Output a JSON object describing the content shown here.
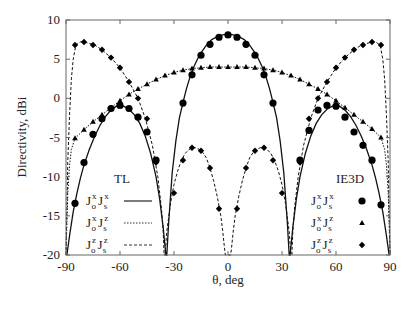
{
  "chart_data": {
    "type": "line",
    "title": "",
    "xlabel": "θ, deg",
    "ylabel": "Directivity, dBi",
    "xlim": [
      -90,
      90
    ],
    "ylim": [
      -20,
      10
    ],
    "xticks": [
      -90,
      -60,
      -30,
      0,
      30,
      60,
      90
    ],
    "yticks": [
      10,
      5,
      0,
      -5,
      -10,
      -15,
      -20
    ],
    "grid": false,
    "legend": {
      "tl_title": "TL",
      "ie3d_title": "IE3D",
      "entries": [
        {
          "label_main1": "J",
          "sup1": "x",
          "sub1": "o",
          "label_main2": "J",
          "sup2": "x",
          "sub2": "s",
          "tl_style": "solid",
          "ie3d_marker": "circle"
        },
        {
          "label_main1": "J",
          "sup1": "x",
          "sub1": "o",
          "label_main2": "J",
          "sup2": "z",
          "sub2": "s",
          "tl_style": "dotted",
          "ie3d_marker": "triangle"
        },
        {
          "label_main1": "J",
          "sup1": "z",
          "sub1": "o",
          "label_main2": "J",
          "sup2": "z",
          "sub2": "s",
          "tl_style": "dashed",
          "ie3d_marker": "diamond"
        }
      ]
    },
    "series": [
      {
        "name": "Jo^x Js^x",
        "method_tl": "solid",
        "marker": "circle",
        "tl_curve": {
          "x": [
            -89.5,
            -88,
            -86,
            -84,
            -82,
            -80,
            -77,
            -74,
            -71,
            -68,
            -65,
            -62,
            -60,
            -58,
            -55,
            -52,
            -49,
            -46,
            -43,
            -40,
            -38,
            -36,
            -34.5,
            -34,
            -33,
            -31,
            -29,
            -27,
            -25,
            -23,
            -21,
            -19,
            -17,
            -15,
            -12,
            -9,
            -6,
            -3,
            0,
            3,
            6,
            9,
            12,
            15,
            17,
            19,
            21,
            23,
            25,
            27,
            29,
            31,
            33,
            34,
            34.5,
            36,
            38,
            40,
            43,
            46,
            49,
            52,
            55,
            58,
            60,
            62,
            65,
            68,
            71,
            74,
            77,
            80,
            82,
            84,
            86,
            88,
            89.5
          ],
          "y": [
            -20,
            -17.5,
            -14.5,
            -12.2,
            -10.2,
            -8.5,
            -6.5,
            -4.8,
            -3.4,
            -2.3,
            -1.5,
            -1.0,
            -0.9,
            -1.0,
            -1.4,
            -2.1,
            -3.2,
            -4.8,
            -7.0,
            -10.0,
            -12.8,
            -16.5,
            -20,
            -20,
            -16,
            -9.5,
            -5.5,
            -2.5,
            -0.5,
            1.3,
            2.8,
            4.0,
            5.0,
            5.8,
            6.8,
            7.5,
            7.9,
            8.1,
            8.2,
            8.1,
            7.9,
            7.5,
            6.8,
            5.8,
            5.0,
            4.0,
            2.8,
            1.3,
            -0.5,
            -2.5,
            -5.5,
            -9.5,
            -16,
            -20,
            -20,
            -16.5,
            -12.8,
            -10.0,
            -7.0,
            -4.8,
            -3.2,
            -2.1,
            -1.4,
            -1.0,
            -0.9,
            -1.0,
            -1.5,
            -2.3,
            -3.4,
            -4.8,
            -6.5,
            -8.5,
            -10.2,
            -12.2,
            -14.5,
            -17.5,
            -20
          ]
        },
        "ie3d_points": {
          "x": [
            -85,
            -80,
            -75,
            -70,
            -65,
            -60,
            -55,
            -50,
            -45,
            -40,
            -25,
            -20,
            -15,
            -10,
            -5,
            0,
            5,
            10,
            15,
            20,
            25,
            40,
            45,
            50,
            55,
            60,
            65,
            70,
            75,
            80,
            85
          ],
          "y": [
            -13.4,
            -8.2,
            -4.6,
            -2.6,
            -1.3,
            -0.9,
            -1.3,
            -2.4,
            -4.3,
            -7.9,
            -0.6,
            3.0,
            5.5,
            6.9,
            7.8,
            8.1,
            7.8,
            6.9,
            5.5,
            3.0,
            -0.6,
            -7.9,
            -4.1,
            -1.5,
            -0.9,
            -1.0,
            -2.4,
            -4.3,
            -6.0,
            -7.9,
            -13.6
          ]
        }
      },
      {
        "name": "Jo^x Js^z",
        "method_tl": "dotted",
        "marker": "triangle",
        "tl_curve": {
          "x": [
            -90,
            -89.5,
            -89,
            -88,
            -87,
            -85,
            -80,
            -75,
            -70,
            -65,
            -60,
            -55,
            -50,
            -45,
            -40,
            -35,
            -30,
            -25,
            -20,
            -15,
            -10,
            -5,
            0,
            5,
            10,
            15,
            20,
            25,
            30,
            35,
            40,
            45,
            50,
            55,
            60,
            65,
            70,
            75,
            80,
            85,
            87,
            88,
            89,
            89.5,
            90
          ],
          "y": [
            -20,
            -16,
            -12,
            -8.5,
            -6.5,
            -5.1,
            -4.0,
            -3.0,
            -2.1,
            -1.2,
            -0.3,
            0.5,
            1.2,
            1.8,
            2.4,
            2.9,
            3.3,
            3.6,
            3.8,
            3.9,
            4.0,
            4.0,
            4.0,
            4.0,
            4.0,
            3.9,
            3.8,
            3.6,
            3.3,
            2.9,
            2.4,
            1.8,
            1.2,
            0.5,
            -0.3,
            -1.2,
            -2.1,
            -3.0,
            -3.9,
            -5.0,
            -6.5,
            -8.5,
            -12,
            -16,
            -20
          ]
        },
        "ie3d_points": {
          "x": [
            -85,
            -80,
            -75,
            -70,
            -65,
            -60,
            -55,
            -50,
            -45,
            -40,
            -35,
            -30,
            -25,
            -20,
            -15,
            -10,
            -5,
            0,
            5,
            10,
            15,
            20,
            25,
            30,
            35,
            40,
            45,
            50,
            55,
            60,
            65,
            70,
            75,
            80,
            85
          ],
          "y": [
            -5.1,
            -4.0,
            -3.0,
            -2.1,
            -1.2,
            -0.3,
            0.5,
            1.2,
            1.8,
            2.4,
            2.9,
            3.3,
            3.6,
            3.8,
            3.9,
            4.0,
            4.0,
            4.0,
            4.0,
            4.0,
            3.9,
            3.8,
            3.6,
            3.3,
            2.9,
            2.4,
            1.8,
            1.2,
            0.5,
            -0.3,
            -1.2,
            -2.1,
            -3.0,
            -3.9,
            -5.0
          ]
        }
      },
      {
        "name": "Jo^z Js^z",
        "method_tl": "dashed",
        "marker": "diamond",
        "tl_curve": {
          "x": [
            -90,
            -89.5,
            -89,
            -88,
            -87,
            -86,
            -84.5,
            -82,
            -80,
            -77,
            -74,
            -70,
            -65,
            -60,
            -55,
            -50,
            -46,
            -42,
            -39,
            -37,
            -36,
            -35.5,
            -35,
            -34,
            -32,
            -30,
            -28,
            -26,
            -24,
            -22,
            -20,
            -18,
            -16,
            -14,
            -12,
            -10,
            -8,
            -6,
            -4,
            -3,
            -2,
            -1.5,
            1.5,
            2,
            3,
            4,
            6,
            8,
            10,
            12,
            14,
            16,
            18,
            20,
            22,
            24,
            26,
            28,
            30,
            32,
            34,
            35,
            35.5,
            36,
            37,
            39,
            42,
            46,
            50,
            55,
            60,
            65,
            70,
            74,
            77,
            80,
            82,
            84.5,
            86,
            87,
            88,
            89,
            89.5,
            90
          ],
          "y": [
            -20,
            -14,
            -8,
            -2,
            2.5,
            5.0,
            6.8,
            7.2,
            7.2,
            7.0,
            6.8,
            6.2,
            5.2,
            3.9,
            2.1,
            0.0,
            -2.5,
            -6.0,
            -10.0,
            -14.0,
            -17.0,
            -20,
            -20,
            -17.0,
            -13.5,
            -11.0,
            -9.3,
            -8.0,
            -7.1,
            -6.6,
            -6.3,
            -6.3,
            -6.5,
            -6.9,
            -7.6,
            -8.9,
            -10.5,
            -12.5,
            -15.0,
            -16.8,
            -19.0,
            -20,
            -20,
            -19.0,
            -16.8,
            -15.0,
            -12.5,
            -10.5,
            -8.9,
            -7.6,
            -6.9,
            -6.5,
            -6.3,
            -6.3,
            -6.6,
            -7.1,
            -8.0,
            -9.3,
            -11.0,
            -13.5,
            -17.0,
            -20,
            -20,
            -17.0,
            -14.0,
            -10.0,
            -6.0,
            -2.5,
            0.0,
            2.1,
            3.9,
            5.2,
            6.2,
            6.8,
            7.0,
            7.2,
            7.2,
            6.8,
            5.0,
            2.5,
            -2,
            -8,
            -14,
            -20
          ]
        },
        "ie3d_points": {
          "x": [
            -85,
            -80,
            -75,
            -70,
            -65,
            -60,
            -55,
            -50,
            -45,
            -40,
            -30,
            -25,
            -20,
            -15,
            -10,
            -5,
            5,
            10,
            15,
            20,
            25,
            30,
            40,
            45,
            50,
            55,
            60,
            65,
            70,
            75,
            80,
            85
          ],
          "y": [
            6.8,
            7.2,
            6.8,
            6.2,
            5.2,
            3.9,
            2.1,
            0.0,
            -2.6,
            -8.2,
            -12.1,
            -7.9,
            -6.3,
            -6.7,
            -8.9,
            -14.1,
            -14.1,
            -8.9,
            -6.7,
            -6.3,
            -7.9,
            -12.1,
            -8.2,
            -2.6,
            0.0,
            2.1,
            3.9,
            5.2,
            6.2,
            6.8,
            7.2,
            6.8
          ]
        }
      }
    ]
  },
  "colors": {
    "axis": "#555555",
    "curve": "#111111",
    "marker": "#000000",
    "background": "#ffffff"
  }
}
